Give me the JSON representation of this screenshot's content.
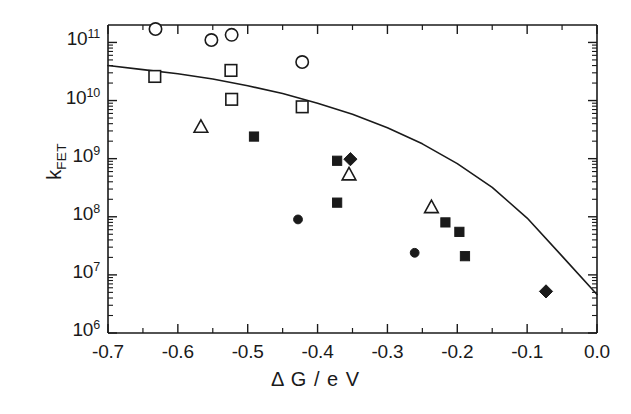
{
  "chart_data": {
    "type": "scatter",
    "title": "",
    "xlabel": "Δ G / e V",
    "ylabel_main": "k",
    "ylabel_sub": "FET",
    "xlim": [
      -0.7,
      0.0
    ],
    "ylim_log10": [
      6,
      11.3
    ],
    "yscale": "log",
    "grid": false,
    "legend": "none",
    "xticks": [
      -0.7,
      -0.6,
      -0.5,
      -0.4,
      -0.3,
      -0.2,
      -0.1,
      0.0
    ],
    "xtick_labels": [
      "-0.7",
      "-0.6",
      "-0.5",
      "-0.4",
      "-0.3",
      "-0.2",
      "-0.1",
      "0.0"
    ],
    "yticks_log10": [
      6,
      7,
      8,
      9,
      10,
      11
    ],
    "ytick_labels": [
      {
        "mantissa": "10",
        "exponent": "6"
      },
      {
        "mantissa": "10",
        "exponent": "7"
      },
      {
        "mantissa": "10",
        "exponent": "8"
      },
      {
        "mantissa": "10",
        "exponent": "9"
      },
      {
        "mantissa": "10",
        "exponent": "10"
      },
      {
        "mantissa": "10",
        "exponent": "11"
      }
    ],
    "series": [
      {
        "name": "open-circle",
        "marker": "open-circle",
        "color": "#1a1a1a",
        "points": [
          {
            "x": -0.632,
            "y": 170000000000.0
          },
          {
            "x": -0.552,
            "y": 110000000000.0
          },
          {
            "x": -0.523,
            "y": 135000000000.0
          },
          {
            "x": -0.422,
            "y": 46000000000.0
          }
        ]
      },
      {
        "name": "open-square",
        "marker": "open-square",
        "color": "#1a1a1a",
        "points": [
          {
            "x": -0.633,
            "y": 26000000000.0
          },
          {
            "x": -0.524,
            "y": 33000000000.0
          },
          {
            "x": -0.523,
            "y": 10500000000.0
          },
          {
            "x": -0.422,
            "y": 7800000000.0
          }
        ]
      },
      {
        "name": "open-triangle",
        "marker": "open-triangle",
        "color": "#1a1a1a",
        "points": [
          {
            "x": -0.567,
            "y": 3500000000.0
          },
          {
            "x": -0.355,
            "y": 530000000.0
          },
          {
            "x": -0.237,
            "y": 145000000.0
          }
        ]
      },
      {
        "name": "filled-square",
        "marker": "filled-square",
        "color": "#1a1a1a",
        "points": [
          {
            "x": -0.491,
            "y": 2400000000.0
          },
          {
            "x": -0.372,
            "y": 920000000.0
          },
          {
            "x": -0.372,
            "y": 175000000.0
          },
          {
            "x": -0.217,
            "y": 80000000.0
          },
          {
            "x": -0.197,
            "y": 55000000.0
          },
          {
            "x": -0.189,
            "y": 21000000.0
          }
        ]
      },
      {
        "name": "filled-circle",
        "marker": "filled-circle",
        "color": "#1a1a1a",
        "points": [
          {
            "x": -0.428,
            "y": 90000000.0
          },
          {
            "x": -0.261,
            "y": 24000000.0
          }
        ]
      },
      {
        "name": "filled-diamond",
        "marker": "filled-diamond",
        "color": "#1a1a1a",
        "points": [
          {
            "x": -0.353,
            "y": 980000000.0
          },
          {
            "x": -0.073,
            "y": 5200000.0
          }
        ]
      }
    ],
    "fit_curve": {
      "name": "marcus-fit-curve",
      "style": "solid",
      "color": "#1a1a1a",
      "points": [
        {
          "x": -0.7,
          "y": 40000000000.0
        },
        {
          "x": -0.65,
          "y": 34000000000.0
        },
        {
          "x": -0.6,
          "y": 29000000000.0
        },
        {
          "x": -0.55,
          "y": 23500000000.0
        },
        {
          "x": -0.5,
          "y": 18000000000.0
        },
        {
          "x": -0.45,
          "y": 13200000000.0
        },
        {
          "x": -0.4,
          "y": 9000000000.0
        },
        {
          "x": -0.35,
          "y": 5800000000.0
        },
        {
          "x": -0.3,
          "y": 3400000000.0
        },
        {
          "x": -0.25,
          "y": 1800000000.0
        },
        {
          "x": -0.2,
          "y": 820000000.0
        },
        {
          "x": -0.15,
          "y": 320000000.0
        },
        {
          "x": -0.1,
          "y": 95000000.0
        },
        {
          "x": -0.05,
          "y": 21000000.0
        },
        {
          "x": 0.0,
          "y": 4600000.0
        }
      ]
    }
  }
}
